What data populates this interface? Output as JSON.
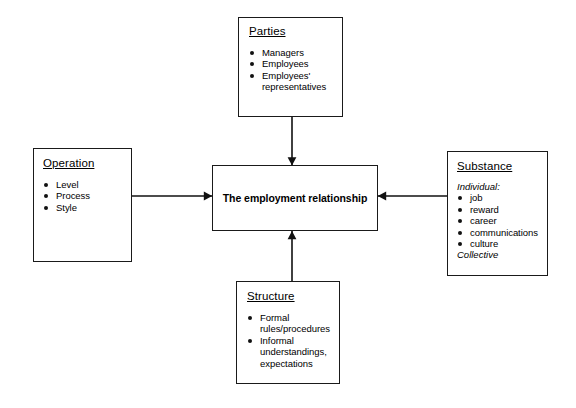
{
  "diagram": {
    "title": "The employment relationship",
    "background_color": "#ffffff",
    "line_color": "#1a1a1a",
    "center": {
      "label": "The employment relationship"
    },
    "nodes": [
      {
        "id": "parties",
        "title": "Parties",
        "items": [
          "Managers",
          "Employees",
          "Employees' representatives"
        ]
      },
      {
        "id": "operation",
        "title": "Operation",
        "items": [
          "Level",
          "Process",
          "Style"
        ]
      },
      {
        "id": "substance",
        "title": "Substance",
        "lead": "Individual:",
        "items": [
          "job",
          "reward",
          "career",
          "communications",
          "culture"
        ],
        "trail": "Collective"
      },
      {
        "id": "structure",
        "title": "Structure",
        "items": [
          "Formal rules/procedures",
          "Informal understandings, expectations"
        ]
      }
    ],
    "arrows": [
      {
        "from": "parties",
        "to": "center",
        "direction": "down"
      },
      {
        "from": "operation",
        "to": "center",
        "direction": "right"
      },
      {
        "from": "substance",
        "to": "center",
        "direction": "left"
      },
      {
        "from": "structure",
        "to": "center",
        "direction": "up"
      }
    ]
  }
}
